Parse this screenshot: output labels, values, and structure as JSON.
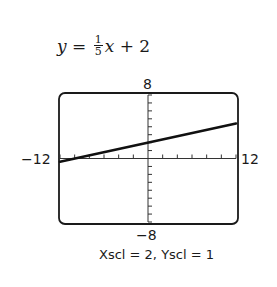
{
  "chart_data": {
    "type": "line",
    "equation": {
      "lhs": "y",
      "eq": " = ",
      "frac_num": "1",
      "frac_den": "5",
      "rest_var": "x",
      "rest": " + 2"
    },
    "xlim": [
      -12,
      12
    ],
    "ylim": [
      -8,
      8
    ],
    "xscl": 2,
    "yscl": 1,
    "series": [
      {
        "name": "y = (1/5)x + 2",
        "slope": 0.2,
        "intercept": 2,
        "x": [
          -12,
          12
        ],
        "y": [
          -0.4,
          4.4
        ]
      }
    ],
    "tick_labels": {
      "ymax": "8",
      "ymin": "−8",
      "xmin": "−12",
      "xmax": "12"
    },
    "caption": "Xscl = 2, Yscl = 1",
    "grid": false,
    "legend": "none"
  }
}
